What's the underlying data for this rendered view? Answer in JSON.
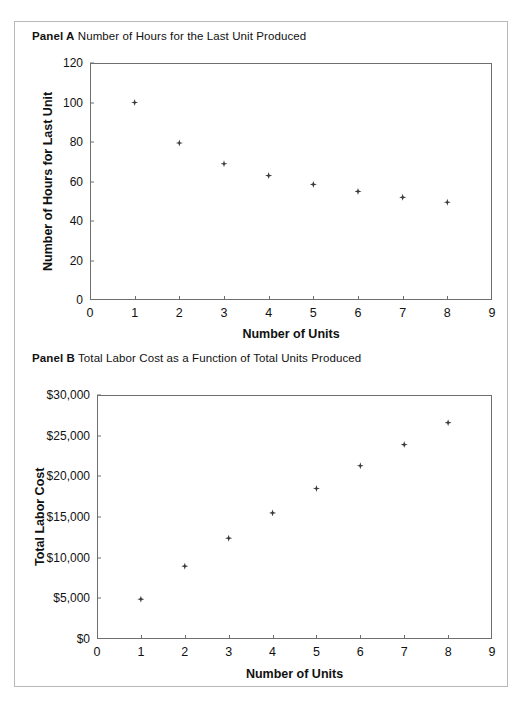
{
  "figure": {
    "panels": [
      {
        "key": "panel-a",
        "label": "Panel A",
        "title": "Number of Hours for the Last Unit Produced"
      },
      {
        "key": "panel-b",
        "label": "Panel B",
        "title": "Total Labor Cost as a Function of Total Units Produced"
      }
    ]
  },
  "chart_data": [
    {
      "type": "scatter",
      "panel": "Panel A",
      "title": "Number of Hours for the Last Unit Produced",
      "xlabel": "Number of Units",
      "ylabel": "Number of Hours for Last Unit",
      "x": [
        1,
        2,
        3,
        4,
        5,
        6,
        7,
        8
      ],
      "values": [
        100,
        79.5,
        69,
        63,
        58.5,
        55,
        52,
        49.5
      ],
      "xlim": [
        0,
        9
      ],
      "ylim": [
        0,
        120
      ],
      "xticks": [
        "0",
        "1",
        "2",
        "3",
        "4",
        "5",
        "6",
        "7",
        "8",
        "9"
      ],
      "yticks": [
        "0",
        "20",
        "40",
        "60",
        "80",
        "100",
        "120"
      ],
      "ytick_values": [
        0,
        20,
        40,
        60,
        80,
        100,
        120
      ],
      "grid": false,
      "legend": "none",
      "marker": "diamond",
      "marker_color": "#3b3b3b"
    },
    {
      "type": "scatter",
      "panel": "Panel B",
      "title": "Total Labor Cost as a Function of Total Units Produced",
      "xlabel": "Number of Units",
      "ylabel": "Total Labor Cost",
      "x": [
        1,
        2,
        3,
        4,
        5,
        6,
        7,
        8
      ],
      "values": [
        4900,
        8950,
        12400,
        15500,
        18500,
        21300,
        23900,
        26600
      ],
      "xlim": [
        0,
        9
      ],
      "ylim": [
        0,
        30000
      ],
      "xticks": [
        "0",
        "1",
        "2",
        "3",
        "4",
        "5",
        "6",
        "7",
        "8",
        "9"
      ],
      "yticks": [
        "$0",
        "$5,000",
        "$10,000",
        "$15,000",
        "$20,000",
        "$25,000",
        "$30,000"
      ],
      "ytick_values": [
        0,
        5000,
        10000,
        15000,
        20000,
        25000,
        30000
      ],
      "grid": false,
      "legend": "none",
      "marker": "diamond",
      "marker_color": "#3b3b3b"
    }
  ]
}
